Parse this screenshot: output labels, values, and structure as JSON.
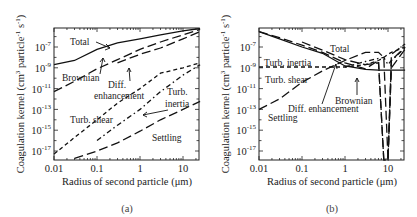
{
  "figure": {
    "panels": [
      {
        "caption": "(a)",
        "xlabel": "Radius of second particle (μm)",
        "ylabel": "Coagulation kernel (cm³ particle⁻¹ s⁻¹)",
        "ylabel_parts": [
          "Coagulation kernel (cm",
          "3",
          " particle",
          "-1",
          " s",
          "-1",
          ")"
        ],
        "xticks": [
          "0.01",
          "0.1",
          "1",
          "10"
        ],
        "yticks": [
          {
            "base": "10",
            "exp": "-7"
          },
          {
            "base": "10",
            "exp": "-9"
          },
          {
            "base": "10",
            "exp": "-11"
          },
          {
            "base": "10",
            "exp": "-13"
          },
          {
            "base": "10",
            "exp": "-15"
          },
          {
            "base": "10",
            "exp": "-17"
          }
        ],
        "annotations": {
          "total": "Total",
          "brownian": "Brownian",
          "diff1": "Diff.",
          "diff2": "enhancement",
          "turb_inertia1": "Turb.",
          "turb_inertia2": "inertia",
          "turb_shear": "Turb. shear",
          "settling": "Settling"
        }
      },
      {
        "caption": "(b)",
        "xlabel": "Radius of second particle (μm)",
        "ylabel": "Coagulation kernel (cm³ particle⁻¹ s⁻¹)",
        "ylabel_parts": [
          "Coagulation kernel (cm",
          "3",
          " particle",
          "-1",
          " s",
          "-1",
          ")"
        ],
        "xticks": [
          "0.01",
          "0.1",
          "1",
          "10"
        ],
        "yticks": [
          {
            "base": "10",
            "exp": "-7"
          },
          {
            "base": "10",
            "exp": "-9"
          },
          {
            "base": "10",
            "exp": "-11"
          },
          {
            "base": "10",
            "exp": "-13"
          },
          {
            "base": "10",
            "exp": "-15"
          },
          {
            "base": "10",
            "exp": "-17"
          }
        ],
        "annotations": {
          "total": "Total",
          "turb_inertia": "Turb. inertia",
          "turb_shear": "Turb. shear",
          "brownian": "Brownian",
          "diff": "Diff. enhancement",
          "settling": "Settling"
        }
      }
    ]
  },
  "chart_data": [
    {
      "type": "line",
      "title": "(a)",
      "xlabel": "Radius of second particle (μm)",
      "ylabel": "Coagulation kernel (cm^3 particle^-1 s^-1)",
      "xscale": "log",
      "yscale": "log",
      "xlim": [
        0.01,
        25
      ],
      "ylim": [
        1e-18,
        6e-06
      ],
      "xticks": [
        0.01,
        0.1,
        1,
        10
      ],
      "yticks": [
        1e-07,
        1e-09,
        1e-11,
        1e-13,
        1e-15,
        1e-17
      ],
      "grid": false,
      "legend": "inline annotations",
      "x": [
        0.01,
        0.03,
        0.1,
        0.3,
        1,
        3,
        10,
        25
      ],
      "series": [
        {
          "name": "Total",
          "style": "solid",
          "values": [
            2e-09,
            5e-09,
            6e-08,
            2.5e-07,
            6e-07,
            1.5e-06,
            3.5e-06,
            6e-06
          ]
        },
        {
          "name": "Brownian",
          "style": "long-dash",
          "values": [
            5e-12,
            5e-11,
            8e-10,
            6e-09,
            6e-08,
            3e-07,
            1.5e-06,
            5e-06
          ]
        },
        {
          "name": "Diff. enhancement",
          "style": "long-dash",
          "values": [
            null,
            null,
            null,
            3e-09,
            2e-08,
            8e-08,
            6e-07,
            3e-06
          ]
        },
        {
          "name": "Turb. inertia",
          "style": "dash-dot",
          "values": [
            null,
            null,
            1e-16,
            3e-15,
            1e-13,
            5e-12,
            2e-10,
            2e-09
          ]
        },
        {
          "name": "Turb. shear",
          "style": "short-dash",
          "values": [
            5e-18,
            2e-16,
            1e-14,
            4e-13,
            1e-11,
            3e-10,
            1e-09,
            3e-09
          ]
        },
        {
          "name": "Settling",
          "style": "long-dash",
          "values": [
            null,
            2e-18,
            1e-17,
            6e-17,
            8e-16,
            1e-14,
            1e-13,
            6e-13
          ]
        }
      ]
    },
    {
      "type": "line",
      "title": "(b)",
      "xlabel": "Radius of second particle (μm)",
      "ylabel": "Coagulation kernel (cm^3 particle^-1 s^-1)",
      "xscale": "log",
      "yscale": "log",
      "xlim": [
        0.01,
        25
      ],
      "ylim": [
        1e-18,
        6e-06
      ],
      "xticks": [
        0.01,
        0.1,
        1,
        10
      ],
      "yticks": [
        1e-07,
        1e-09,
        1e-11,
        1e-13,
        1e-15,
        1e-17
      ],
      "grid": false,
      "legend": "inline annotations",
      "x": [
        0.01,
        0.03,
        0.1,
        0.3,
        1,
        3,
        6,
        8,
        10,
        12,
        25
      ],
      "series": [
        {
          "name": "Total",
          "style": "solid",
          "values": [
            3e-06,
            6e-07,
            1e-07,
            2.5e-08,
            1.5e-09,
            7e-10,
            6e-10,
            6e-10,
            6e-10,
            6e-10,
            6e-10
          ]
        },
        {
          "name": "Brownian",
          "style": "long-dash",
          "values": [
            3e-06,
            8e-07,
            1.5e-07,
            3e-08,
            3e-09,
            8e-10,
            5e-09,
            1e-18,
            1e-18,
            1e-09,
            6e-08
          ]
        },
        {
          "name": "Diff. enhancement",
          "style": "long-dash",
          "values": [
            null,
            null,
            3e-07,
            5e-08,
            6e-09,
            2e-09,
            3e-09,
            1e-18,
            1e-18,
            5e-09,
            1e-07
          ]
        },
        {
          "name": "Turb. inertia",
          "style": "dash-dot",
          "values": [
            null,
            null,
            null,
            null,
            1.2e-09,
            4e-09,
            8e-09,
            1e-08,
            2e-09,
            5e-09,
            8e-08
          ]
        },
        {
          "name": "Turb. shear",
          "style": "short-dash",
          "values": [
            1.2e-09,
            1.2e-09,
            1.2e-09,
            1.2e-09,
            1.2e-09,
            2e-09,
            5e-09,
            1e-08,
            2e-08,
            3e-08,
            1e-07
          ]
        },
        {
          "name": "Settling",
          "style": "long-dash",
          "values": [
            1e-13,
            1e-12,
            4e-11,
            5e-10,
            5e-09,
            3e-08,
            3e-08,
            1e-08,
            1e-18,
            2e-08,
            2e-07
          ]
        }
      ]
    }
  ]
}
